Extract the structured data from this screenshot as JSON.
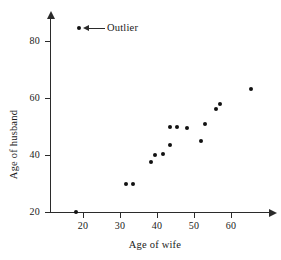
{
  "chart_data": {
    "type": "scatter",
    "title": "",
    "xlabel": "Age of wife",
    "ylabel": "Age of husband",
    "xlim": [
      14,
      68
    ],
    "ylim": [
      18,
      87
    ],
    "xticks": [
      20,
      30,
      40,
      50,
      60
    ],
    "yticks": [
      20,
      40,
      60,
      80
    ],
    "xtick_labels": [
      "20",
      "30",
      "40",
      "50",
      "60"
    ],
    "ytick_labels": [
      "20",
      "40",
      "60",
      "80"
    ],
    "grid": false,
    "legend": "none",
    "points": [
      {
        "x": 18.0,
        "y": 20.0
      },
      {
        "x": 31.5,
        "y": 30.0
      },
      {
        "x": 33.5,
        "y": 30.0
      },
      {
        "x": 38.5,
        "y": 37.5
      },
      {
        "x": 39.5,
        "y": 40.0
      },
      {
        "x": 41.5,
        "y": 40.5
      },
      {
        "x": 43.5,
        "y": 43.5
      },
      {
        "x": 43.5,
        "y": 50.0
      },
      {
        "x": 45.5,
        "y": 50.0
      },
      {
        "x": 48.0,
        "y": 49.5
      },
      {
        "x": 52.0,
        "y": 45.0
      },
      {
        "x": 53.0,
        "y": 51.0
      },
      {
        "x": 56.0,
        "y": 56.0
      },
      {
        "x": 57.0,
        "y": 58.0
      },
      {
        "x": 65.5,
        "y": 63.0
      }
    ],
    "annotations": [
      {
        "text": "Outlier",
        "marker_x": 19.5,
        "marker_y": 83.0
      }
    ],
    "marker_color": "#111111",
    "axis_color": "#2b2b2b"
  }
}
